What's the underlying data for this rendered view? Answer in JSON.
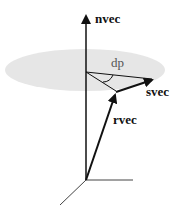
{
  "diagram": {
    "type": "vector-geometry",
    "labels": {
      "nvec": "nvec",
      "svec": "svec",
      "rvec": "rvec",
      "dp": "dp"
    },
    "colors": {
      "plane_fill": "#e6e6e6",
      "line": "#111111",
      "axis_light": "#444444",
      "angle_label": "#555555"
    },
    "elements": [
      {
        "name": "plane",
        "shape": "ellipse",
        "description": "shaded plane perpendicular to nvec"
      },
      {
        "name": "nvec",
        "shape": "arrow",
        "description": "normal vector pointing up"
      },
      {
        "name": "rvec",
        "shape": "arrow",
        "description": "vector from origin to point on plane"
      },
      {
        "name": "svec",
        "shape": "arrow",
        "description": "vector in the plane from rvec tip"
      },
      {
        "name": "dp",
        "shape": "angle-arc",
        "description": "angle in plane between projections"
      },
      {
        "name": "axes",
        "shape": "3d-axes",
        "description": "coordinate axes at origin"
      }
    ]
  }
}
